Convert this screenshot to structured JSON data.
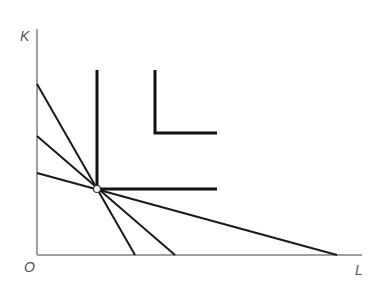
{
  "diagram": {
    "type": "isoquant-leontief",
    "axes": {
      "y_label": "K",
      "x_label": "L",
      "origin_label": "O"
    },
    "isoquants": [
      {
        "name": "lower-isoquant",
        "corner": [
          97,
          189
        ]
      },
      {
        "name": "upper-isoquant",
        "corner": [
          155,
          133
        ]
      }
    ],
    "isocost_lines": [
      {
        "name": "steep-isocost",
        "from": [
          37,
          84
        ],
        "to": [
          135,
          255
        ]
      },
      {
        "name": "medium-isocost",
        "from": [
          37,
          136
        ],
        "to": [
          175,
          255
        ]
      },
      {
        "name": "flat-isocost",
        "from": [
          37,
          173
        ],
        "to": [
          337,
          255
        ]
      }
    ],
    "equilibrium_point": [
      97,
      189
    ],
    "colors": {
      "axis": "#a0a0a0",
      "line": "#1a1a1a",
      "label": "#555555"
    }
  }
}
